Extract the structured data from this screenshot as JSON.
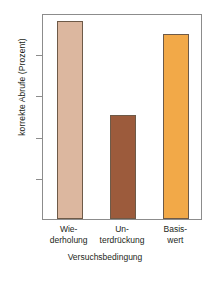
{
  "chart_data": {
    "type": "bar",
    "title": "",
    "categories": [
      "Wie-\nderholung",
      "Un-\nterdrückung",
      "Basis-\nwert"
    ],
    "category_lines": [
      [
        "Wie-",
        "derholung"
      ],
      [
        "Un-",
        "terdrückung"
      ],
      [
        "Basis-",
        "wert"
      ]
    ],
    "values": [
      99.0,
      87.6,
      97.4
    ],
    "xlabel": "Versuchsbedingung",
    "ylabel": "korrekte Abrufe (Prozent)",
    "ylim": [
      75,
      100
    ],
    "yticks": [
      100,
      95,
      90,
      85,
      80,
      75
    ],
    "ytick_labels": [
      "100",
      "95",
      "90",
      "85",
      "80",
      "75"
    ],
    "grid": false,
    "legend": "none",
    "bar_colors": [
      "#dcb79f",
      "#9c5b3c",
      "#f2a948"
    ],
    "bar_border_color": "#6e5a48",
    "frame_color": "#8c8c8c",
    "text_color": "#231f20"
  }
}
